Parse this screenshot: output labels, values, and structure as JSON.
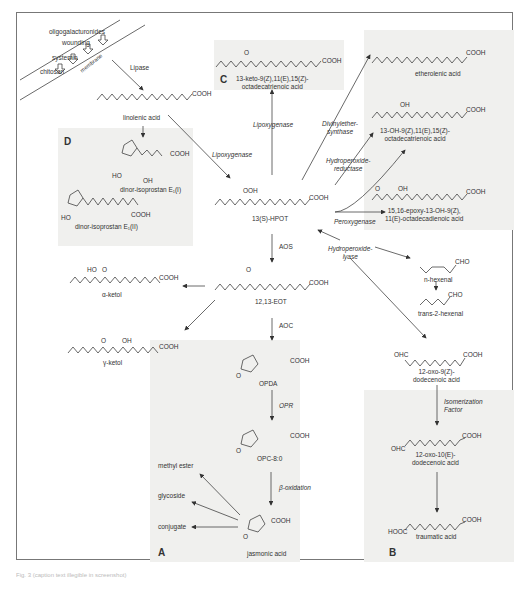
{
  "figure": {
    "caption": "Fig. 3 (caption text illegible in screenshot)",
    "panels": {
      "A": "A",
      "B": "B",
      "C": "C",
      "D": "D"
    },
    "signals": {
      "items": [
        "oligogalacturonides",
        "wounding",
        "systemin",
        "chitosan"
      ],
      "membrane": "membrane"
    },
    "enzymes": {
      "lipase": "Lipase",
      "lipoxygenase_1": "Lipoxygenase",
      "lipoxygenase_2": "Lipoxygenase",
      "divinylether_synthase": "Divinylether-\nsynthase",
      "hydroperoxide_reductase": "Hydroperoxide-\nreductase",
      "peroxygenase": "Peroxygenase",
      "hydroperoxide_lyase": "Hydroperoxide-\nlyase",
      "aos": "AOS",
      "aoc": "AOC",
      "opr": "OPR",
      "beta_oxidation": "β-oxidation",
      "isomerization_factor": "Isomerization\nFactor"
    },
    "compounds": {
      "linolenic_acid": "linolenic acid",
      "dinor_isoprostan_i": "dinor-isoprostan E₁(I)",
      "dinor_isoprostan_ii": "dinor-isoprostan E₁(II)",
      "keto_octadecatrienoic": "13-keto-9(Z),11(E),15(Z)-\noctadecatrienoic acid",
      "etherolenic_acid": "etherolenic acid",
      "hydroxy_octadecatrienoic": "13-OH-9(Z),11(E),15(Z)-\noctadecatrienoic acid",
      "epoxy_hydroxy_octadecadienoic": "15,16-epoxy-13-OH-9(Z),\n11(E)-octadecadienoic acid",
      "hpot": "13(S)-HPOT",
      "eot": "12,13-EOT",
      "alpha_ketol": "α-ketol",
      "gamma_ketol": "γ-ketol",
      "n_hexenal": "n-hexenal",
      "trans_2_hexenal": "trans-2-hexenal",
      "oxo_dodecenoic_9z": "12-oxo-9(Z)-\ndodecenoic acid",
      "oxo_dodecenoic_10e": "12-oxo-10(E)-\ndodecenoic acid",
      "traumatic_acid": "traumatic acid",
      "opda": "OPDA",
      "opc80": "OPC-8:0",
      "jasmonic_acid": "jasmonic acid",
      "methyl_ester": "methyl ester",
      "glycoside": "glycoside",
      "conjugate": "conjugate"
    },
    "groups": {
      "cooh": "COOH",
      "hooc": "HOOC",
      "cho": "CHO",
      "ohc": "OHC",
      "ooh": "OOH",
      "oh": "OH",
      "ho": "HO",
      "o": "O"
    }
  }
}
